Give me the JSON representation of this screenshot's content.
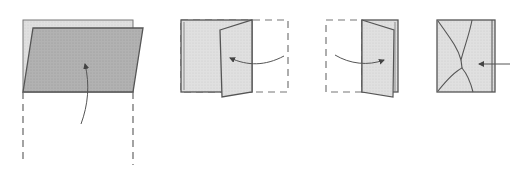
{
  "diagram": {
    "type": "folding-instructions",
    "colors": {
      "background": "#ffffff",
      "paper_light": "#e2e2e2",
      "paper_dark": "#b4b4b4",
      "outline": "#555555",
      "dash": "#666666",
      "arrow": "#555555"
    },
    "steps": [
      {
        "id": 1,
        "description": "Fold bottom flap up over the back sheet",
        "arrow_direction": "up"
      },
      {
        "id": 2,
        "description": "Fold right panel toward the left",
        "arrow_direction": "left"
      },
      {
        "id": 3,
        "description": "Fold left panel toward the right",
        "arrow_direction": "right"
      },
      {
        "id": 4,
        "description": "Result: pinched folded sheet; push in from right",
        "arrow_direction": "left"
      }
    ]
  }
}
